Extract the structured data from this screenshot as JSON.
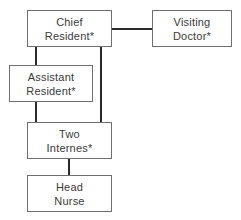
{
  "diagram": {
    "type": "organizational-chart",
    "background_color": "#ffffff",
    "box_border_color": "#6f6f6f",
    "connector_color": "#2b2b2b",
    "text_color": "#3a3a3a",
    "nodes": [
      {
        "id": "chief-resident",
        "lines": [
          "Chief",
          "Resident*"
        ],
        "line1": "Chief",
        "line2": "Resident*",
        "has_asterisk": true,
        "level": 1
      },
      {
        "id": "visiting-doctor",
        "lines": [
          "Visiting",
          "Doctor*"
        ],
        "line1": "Visiting",
        "line2": "Doctor*",
        "has_asterisk": true,
        "level": 1
      },
      {
        "id": "assistant-resident",
        "lines": [
          "Assistant",
          "Resident*"
        ],
        "line1": "Assistant",
        "line2": "Resident*",
        "has_asterisk": true,
        "level": 2
      },
      {
        "id": "two-internes",
        "lines": [
          "Two",
          "Internes*"
        ],
        "line1": "Two",
        "line2": "Internes*",
        "has_asterisk": true,
        "level": 3
      },
      {
        "id": "head-nurse",
        "lines": [
          "Head",
          "Nurse"
        ],
        "line1": "Head",
        "line2": "Nurse",
        "has_asterisk": false,
        "level": 4
      }
    ],
    "connectors": [
      {
        "id": "chief-to-visiting",
        "from": "chief-resident",
        "to": "visiting-doctor",
        "orientation": "horizontal"
      },
      {
        "id": "chief-to-assistant",
        "from": "chief-resident",
        "to": "assistant-resident",
        "orientation": "vertical"
      },
      {
        "id": "chief-to-internes",
        "from": "chief-resident",
        "to": "two-internes",
        "orientation": "vertical"
      },
      {
        "id": "assistant-to-internes",
        "from": "assistant-resident",
        "to": "two-internes",
        "orientation": "vertical"
      },
      {
        "id": "internes-to-nurse",
        "from": "two-internes",
        "to": "head-nurse",
        "orientation": "vertical"
      }
    ]
  }
}
